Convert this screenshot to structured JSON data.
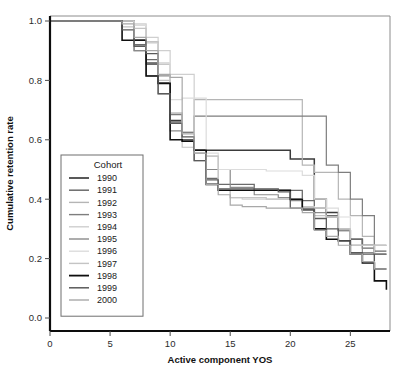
{
  "chart_data": {
    "type": "line",
    "title": "",
    "xlabel": "Active component YOS",
    "ylabel": "Cumulative retention rate",
    "xlim": [
      0,
      28.3
    ],
    "ylim": [
      0,
      1.0
    ],
    "xticks": [
      0,
      5,
      10,
      15,
      20,
      25
    ],
    "xticklabels": [
      "0",
      "5",
      "10",
      "15",
      "20",
      "25"
    ],
    "yticks": [
      0.0,
      0.2,
      0.4,
      0.6,
      0.8,
      1.0
    ],
    "yticklabels": [
      "0.0",
      "0.2",
      "0.4",
      "0.6",
      "0.8",
      "1.0"
    ],
    "grid": false,
    "step_type": "post",
    "legend": {
      "title": "Cohort",
      "position": "inner-left",
      "entries": [
        "1990",
        "1991",
        "1992",
        "1993",
        "1994",
        "1995",
        "1996",
        "1997",
        "1998",
        "1999",
        "2000"
      ]
    },
    "series": [
      {
        "name": "1990",
        "color": "#3b3b3b",
        "width": 1.5,
        "x": [
          0,
          6,
          7,
          8,
          9,
          10,
          11,
          12,
          19,
          20,
          21,
          22,
          23,
          24,
          25,
          26,
          27,
          28
        ],
        "y": [
          1.0,
          1.0,
          0.935,
          0.855,
          0.79,
          0.665,
          0.6,
          0.565,
          0.565,
          0.535,
          0.535,
          0.4,
          0.355,
          0.295,
          0.265,
          0.245,
          0.215,
          0.215
        ]
      },
      {
        "name": "1991",
        "color": "#6b6b6b",
        "width": 1.3,
        "x": [
          0,
          6,
          7,
          8,
          9,
          10,
          11,
          12,
          13,
          14,
          17,
          20,
          21,
          22,
          23,
          24,
          25,
          26,
          27,
          28
        ],
        "y": [
          1.0,
          1.0,
          0.92,
          0.87,
          0.79,
          0.66,
          0.6,
          0.565,
          0.47,
          0.45,
          0.43,
          0.43,
          0.395,
          0.37,
          0.345,
          0.3,
          0.265,
          0.235,
          0.225,
          0.225
        ]
      },
      {
        "name": "1992",
        "color": "#b5b5b5",
        "width": 1.2,
        "x": [
          0,
          6,
          7,
          8,
          9,
          10,
          11,
          12,
          20,
          21,
          22,
          23,
          24,
          25,
          26,
          27,
          28
        ],
        "y": [
          1.0,
          1.0,
          0.985,
          0.93,
          0.855,
          0.69,
          0.625,
          0.735,
          0.735,
          0.515,
          0.49,
          0.49,
          0.4,
          0.345,
          0.275,
          0.245,
          0.245
        ]
      },
      {
        "name": "1993",
        "color": "#7e7e7e",
        "width": 1.2,
        "x": [
          0,
          6,
          7,
          8,
          9,
          10,
          11,
          12,
          22,
          23,
          24,
          25,
          26,
          27,
          28
        ],
        "y": [
          1.0,
          1.0,
          0.9,
          0.86,
          0.755,
          0.685,
          0.625,
          0.68,
          0.68,
          0.515,
          0.49,
          0.4,
          0.345,
          0.245,
          0.245
        ]
      },
      {
        "name": "1994",
        "color": "#cfcfcf",
        "width": 1.2,
        "x": [
          0,
          6,
          7,
          8,
          9,
          10,
          11,
          12,
          13,
          14,
          15,
          16,
          18,
          20,
          21,
          22,
          23,
          24,
          25,
          26,
          27,
          28
        ],
        "y": [
          1.0,
          1.0,
          0.99,
          0.945,
          0.9,
          0.82,
          0.82,
          0.555,
          0.545,
          0.43,
          0.405,
          0.4,
          0.4,
          0.4,
          0.375,
          0.37,
          0.34,
          0.3,
          0.245,
          0.245,
          0.165,
          0.165
        ]
      },
      {
        "name": "1995",
        "color": "#8a8a8a",
        "width": 1.2,
        "x": [
          0,
          6,
          7,
          8,
          9,
          10,
          11,
          12,
          13,
          14,
          15,
          17,
          19,
          20,
          21,
          22,
          23,
          24,
          25,
          26,
          27,
          28
        ],
        "y": [
          1.0,
          1.0,
          0.9,
          0.815,
          0.815,
          0.63,
          0.595,
          0.53,
          0.5,
          0.5,
          0.44,
          0.415,
          0.405,
          0.395,
          0.37,
          0.355,
          0.34,
          0.295,
          0.245,
          0.22,
          0.215,
          0.215
        ]
      },
      {
        "name": "1996",
        "color": "#dcdcdc",
        "width": 1.2,
        "x": [
          0,
          6,
          7,
          8,
          9,
          10,
          11,
          12,
          13,
          14,
          16,
          18,
          20,
          21,
          22,
          23,
          24,
          25,
          26,
          27,
          28
        ],
        "y": [
          1.0,
          1.0,
          0.985,
          0.925,
          0.86,
          0.735,
          0.74,
          0.74,
          0.555,
          0.5,
          0.5,
          0.495,
          0.495,
          0.48,
          0.4,
          0.37,
          0.34,
          0.245,
          0.245,
          0.245,
          0.245
        ]
      },
      {
        "name": "1997",
        "color": "#c4c4c4",
        "width": 1.2,
        "x": [
          0,
          5,
          6,
          7,
          8,
          9,
          10,
          11,
          12,
          13,
          14,
          15,
          16,
          18,
          20,
          21,
          22,
          23,
          24,
          25,
          26,
          27,
          28
        ],
        "y": [
          1.0,
          1.0,
          0.98,
          0.975,
          0.93,
          0.8,
          0.69,
          0.575,
          0.555,
          0.545,
          0.43,
          0.405,
          0.405,
          0.4,
          0.4,
          0.375,
          0.345,
          0.34,
          0.3,
          0.245,
          0.245,
          0.165,
          0.165
        ]
      },
      {
        "name": "1998",
        "color": "#0f0f0f",
        "width": 1.6,
        "x": [
          0,
          5,
          6,
          7,
          8,
          9,
          10,
          11,
          12,
          13,
          14,
          20,
          21,
          22,
          23,
          24,
          25,
          26,
          27,
          28
        ],
        "y": [
          1.0,
          1.0,
          0.935,
          0.935,
          0.815,
          0.79,
          0.6,
          0.595,
          0.565,
          0.45,
          0.43,
          0.4,
          0.365,
          0.3,
          0.265,
          0.26,
          0.215,
          0.185,
          0.125,
          0.095
        ]
      },
      {
        "name": "1999",
        "color": "#5a5a5a",
        "width": 1.3,
        "x": [
          0,
          5,
          6,
          7,
          8,
          9,
          10,
          11,
          12,
          13,
          14,
          19,
          20,
          21,
          22,
          23,
          24,
          25,
          26,
          27,
          28
        ],
        "y": [
          1.0,
          1.0,
          0.97,
          0.915,
          0.89,
          0.755,
          0.655,
          0.61,
          0.53,
          0.465,
          0.435,
          0.425,
          0.37,
          0.365,
          0.335,
          0.3,
          0.26,
          0.22,
          0.215,
          0.165,
          0.165
        ]
      },
      {
        "name": "2000",
        "color": "#a8a8a8",
        "width": 1.2,
        "x": [
          0,
          5,
          6,
          7,
          8,
          9,
          10,
          11,
          12,
          13,
          14,
          15,
          16,
          18,
          20,
          21,
          22,
          23,
          24,
          25,
          26,
          27,
          28
        ],
        "y": [
          1.0,
          1.0,
          0.99,
          0.945,
          0.9,
          0.82,
          0.81,
          0.62,
          0.555,
          0.45,
          0.415,
          0.38,
          0.375,
          0.37,
          0.37,
          0.355,
          0.295,
          0.275,
          0.245,
          0.215,
          0.19,
          0.165,
          0.165
        ]
      }
    ]
  },
  "caption": {
    "text": ""
  }
}
